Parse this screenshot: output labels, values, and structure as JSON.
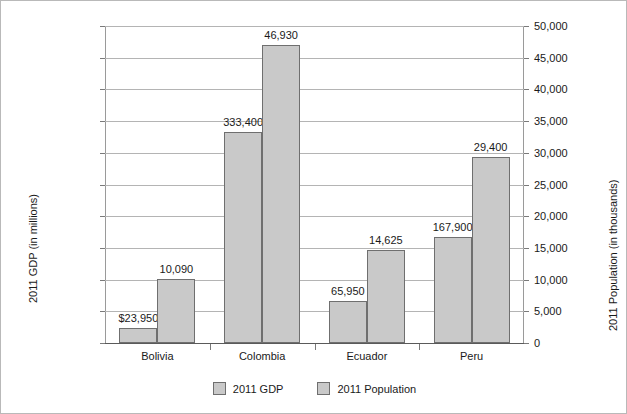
{
  "chart_data": {
    "type": "bar",
    "title": "",
    "categories": [
      "Bolivia",
      "Colombia",
      "Ecuador",
      "Peru"
    ],
    "series": [
      {
        "name": "2011 GDP",
        "axis": "left",
        "values": [
          23950,
          333400,
          65950,
          167900
        ],
        "labels": [
          "$23,950",
          "333,400",
          "65,950",
          "167,900"
        ]
      },
      {
        "name": "2011 Population",
        "axis": "right",
        "values": [
          10090,
          46930,
          14625,
          29400
        ],
        "labels": [
          "10,090",
          "46,930",
          "14,625",
          "29,400"
        ]
      }
    ],
    "xlabel": "",
    "ylabel": "2011 GDP (in millions)",
    "ylabel_right": "2011 Population (in thousands)",
    "ylim": [
      0,
      500000
    ],
    "ylim_right": [
      0,
      50000
    ],
    "ytick_labels_left": [
      "$500,000",
      "$450,000",
      "$400,000",
      "$350,000",
      "$300,000",
      "$250,000",
      "$200,000",
      "$150,000",
      "$100,000",
      "$50,000",
      "$0"
    ],
    "ytick_values_left": [
      500000,
      450000,
      400000,
      350000,
      300000,
      250000,
      200000,
      150000,
      100000,
      50000,
      0
    ],
    "ytick_labels_right": [
      "50,000",
      "45,000",
      "40,000",
      "35,000",
      "30,000",
      "25,000",
      "20,000",
      "15,000",
      "10,000",
      "5,000",
      "0"
    ],
    "ytick_values_right": [
      50000,
      45000,
      40000,
      35000,
      30000,
      25000,
      20000,
      15000,
      10000,
      5000,
      0
    ],
    "grid": true,
    "legend_position": "bottom",
    "legend_entries": [
      "2011 GDP",
      "2011 Population"
    ],
    "bar_color": "#c9c9c9",
    "bar_border_color": "#6f6f6f",
    "grid_color": "#b4b4b4",
    "background": "#ffffff"
  }
}
